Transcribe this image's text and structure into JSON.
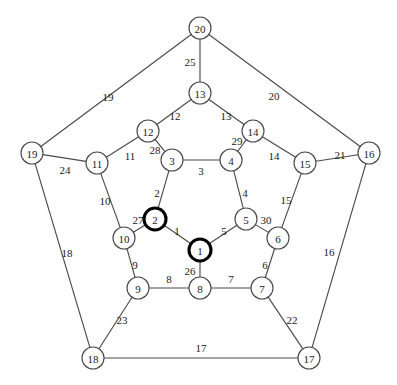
{
  "figure": {
    "type": "graph-diagram",
    "width": 397,
    "height": 385,
    "background_color": "#ffffff",
    "line_color": "#4a4a4a",
    "text_color": "#1a1a1a",
    "highlight_color": "#000000",
    "node_radius": 11,
    "highlighted_nodes": [
      1,
      2
    ]
  },
  "nodes": [
    {
      "id": "n1",
      "label": "1",
      "x": 200,
      "y": 250,
      "highlight": true
    },
    {
      "id": "n2",
      "label": "2",
      "x": 155,
      "y": 219,
      "highlight": true
    },
    {
      "id": "n3",
      "label": "3",
      "x": 172,
      "y": 160,
      "highlight": false
    },
    {
      "id": "n4",
      "label": "4",
      "x": 231,
      "y": 160,
      "highlight": false
    },
    {
      "id": "n5",
      "label": "5",
      "x": 246,
      "y": 219,
      "highlight": false
    },
    {
      "id": "n6",
      "label": "6",
      "x": 278,
      "y": 238,
      "highlight": false
    },
    {
      "id": "n7",
      "label": "7",
      "x": 262,
      "y": 288,
      "highlight": false
    },
    {
      "id": "n8",
      "label": "8",
      "x": 200,
      "y": 288,
      "highlight": false
    },
    {
      "id": "n9",
      "label": "9",
      "x": 138,
      "y": 288,
      "highlight": false
    },
    {
      "id": "n10",
      "label": "10",
      "x": 124,
      "y": 238,
      "highlight": false
    },
    {
      "id": "n11",
      "label": "11",
      "x": 97,
      "y": 163,
      "highlight": false
    },
    {
      "id": "n12",
      "label": "12",
      "x": 148,
      "y": 131,
      "highlight": false
    },
    {
      "id": "n13",
      "label": "13",
      "x": 200,
      "y": 93,
      "highlight": false
    },
    {
      "id": "n14",
      "label": "14",
      "x": 253,
      "y": 131,
      "highlight": false
    },
    {
      "id": "n15",
      "label": "15",
      "x": 305,
      "y": 163,
      "highlight": false
    },
    {
      "id": "n16",
      "label": "16",
      "x": 369,
      "y": 153,
      "highlight": false
    },
    {
      "id": "n17",
      "label": "17",
      "x": 309,
      "y": 358,
      "highlight": false
    },
    {
      "id": "n18",
      "label": "18",
      "x": 93,
      "y": 358,
      "highlight": false
    },
    {
      "id": "n19",
      "label": "19",
      "x": 32,
      "y": 153,
      "highlight": false
    },
    {
      "id": "n20",
      "label": "20",
      "x": 200,
      "y": 28,
      "highlight": false
    }
  ],
  "edges": [
    {
      "from": "n1",
      "to": "n2",
      "label": "1",
      "lx": 177,
      "ly": 231
    },
    {
      "from": "n2",
      "to": "n3",
      "label": "2",
      "lx": 157,
      "ly": 193
    },
    {
      "from": "n3",
      "to": "n4",
      "label": "3",
      "lx": 201,
      "ly": 171
    },
    {
      "from": "n4",
      "to": "n5",
      "label": "4",
      "lx": 245,
      "ly": 193
    },
    {
      "from": "n5",
      "to": "n1",
      "label": "5",
      "lx": 224,
      "ly": 231
    },
    {
      "from": "n6",
      "to": "n7",
      "label": "6",
      "lx": 265,
      "ly": 265
    },
    {
      "from": "n7",
      "to": "n8",
      "label": "7",
      "lx": 231,
      "ly": 279
    },
    {
      "from": "n8",
      "to": "n9",
      "label": "8",
      "lx": 169,
      "ly": 279
    },
    {
      "from": "n9",
      "to": "n10",
      "label": "9",
      "lx": 135,
      "ly": 265
    },
    {
      "from": "n10",
      "to": "n11",
      "label": "10",
      "lx": 105,
      "ly": 201
    },
    {
      "from": "n11",
      "to": "n12",
      "label": "11",
      "lx": 130,
      "ly": 156
    },
    {
      "from": "n12",
      "to": "n13",
      "label": "12",
      "lx": 175,
      "ly": 116
    },
    {
      "from": "n13",
      "to": "n14",
      "label": "13",
      "lx": 226,
      "ly": 116
    },
    {
      "from": "n14",
      "to": "n15",
      "label": "14",
      "lx": 274,
      "ly": 156
    },
    {
      "from": "n15",
      "to": "n6",
      "label": "15",
      "lx": 286,
      "ly": 200
    },
    {
      "from": "n16",
      "to": "n17",
      "label": "16",
      "lx": 329,
      "ly": 252
    },
    {
      "from": "n18",
      "to": "n17",
      "label": "17",
      "lx": 201,
      "ly": 348
    },
    {
      "from": "n19",
      "to": "n18",
      "label": "18",
      "lx": 67,
      "ly": 253
    },
    {
      "from": "n19",
      "to": "n20",
      "label": "19",
      "lx": 108,
      "ly": 97
    },
    {
      "from": "n20",
      "to": "n16",
      "label": "20",
      "lx": 274,
      "ly": 96
    },
    {
      "from": "n15",
      "to": "n16",
      "label": "21",
      "lx": 340,
      "ly": 155
    },
    {
      "from": "n7",
      "to": "n17",
      "label": "22",
      "lx": 292,
      "ly": 320
    },
    {
      "from": "n9",
      "to": "n18",
      "label": "23",
      "lx": 122,
      "ly": 320
    },
    {
      "from": "n19",
      "to": "n11",
      "label": "24",
      "lx": 65,
      "ly": 170
    },
    {
      "from": "n20",
      "to": "n13",
      "label": "25",
      "lx": 190,
      "ly": 62
    },
    {
      "from": "n1",
      "to": "n8",
      "label": "26",
      "lx": 190,
      "ly": 271
    },
    {
      "from": "n2",
      "to": "n10",
      "label": "27",
      "lx": 138,
      "ly": 220
    },
    {
      "from": "n3",
      "to": "n12",
      "label": "28",
      "lx": 155,
      "ly": 150
    },
    {
      "from": "n4",
      "to": "n14",
      "label": "29",
      "lx": 237,
      "ly": 141
    },
    {
      "from": "n5",
      "to": "n6",
      "label": "30",
      "lx": 266,
      "ly": 220
    }
  ]
}
